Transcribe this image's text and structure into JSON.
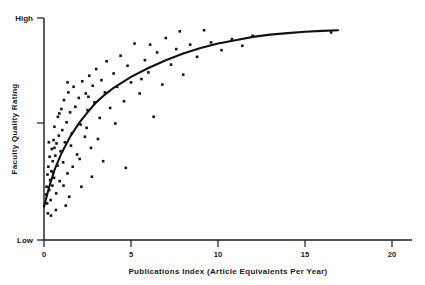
{
  "figure": {
    "background_color": "#ffffff",
    "ink_color": "#151515"
  },
  "axes": {
    "y": {
      "title": "Faculty Quality Rating",
      "low_label": "Low",
      "high_label": "High"
    },
    "x": {
      "title": "Publications Index (Article Equivalents Per Year)",
      "tick_labels": [
        "0",
        "5",
        "10",
        "15",
        "20"
      ]
    }
  },
  "chart_data": {
    "type": "scatter",
    "title": "",
    "subtitle": "",
    "xlabel": "Publications Index (Article Equivalents Per Year)",
    "ylabel": "Faculty Quality Rating",
    "xlim": [
      0,
      21.5
    ],
    "ylim": [
      0,
      100
    ],
    "xticks": [
      0,
      5,
      10,
      15,
      20
    ],
    "xtick_labels": [
      "0",
      "5",
      "10",
      "15",
      "20"
    ],
    "yticks": [
      0,
      50,
      100
    ],
    "ytick_labels": [
      "Low",
      "",
      "High"
    ],
    "grid": false,
    "legend": null,
    "annotations": [],
    "marker": "square",
    "marker_size_px": 2.6,
    "series": [
      {
        "name": "Departments",
        "points": [
          [
            0.12,
            20.5
          ],
          [
            0.15,
            24.0
          ],
          [
            0.18,
            16.5
          ],
          [
            0.2,
            29.5
          ],
          [
            0.22,
            12.0
          ],
          [
            0.25,
            33.0
          ],
          [
            0.3,
            22.5
          ],
          [
            0.32,
            37.5
          ],
          [
            0.35,
            27.0
          ],
          [
            0.38,
            18.0
          ],
          [
            0.42,
            31.0
          ],
          [
            0.45,
            41.0
          ],
          [
            0.48,
            24.5
          ],
          [
            0.5,
            35.5
          ],
          [
            0.55,
            45.0
          ],
          [
            0.58,
            28.0
          ],
          [
            0.6,
            51.0
          ],
          [
            0.65,
            38.0
          ],
          [
            0.7,
            21.0
          ],
          [
            0.72,
            43.5
          ],
          [
            0.78,
            33.5
          ],
          [
            0.8,
            55.5
          ],
          [
            0.85,
            47.0
          ],
          [
            0.9,
            26.5
          ],
          [
            0.95,
            40.0
          ],
          [
            1.0,
            59.0
          ],
          [
            1.05,
            49.5
          ],
          [
            1.1,
            35.0
          ],
          [
            1.15,
            63.0
          ],
          [
            1.2,
            44.0
          ],
          [
            1.3,
            53.0
          ],
          [
            1.35,
            30.0
          ],
          [
            1.4,
            66.5
          ],
          [
            1.5,
            57.5
          ],
          [
            1.55,
            42.5
          ],
          [
            1.6,
            48.0
          ],
          [
            1.7,
            69.0
          ],
          [
            1.8,
            60.0
          ],
          [
            1.9,
            38.5
          ],
          [
            2.0,
            64.0
          ],
          [
            2.1,
            52.0
          ],
          [
            2.2,
            71.5
          ],
          [
            2.35,
            46.5
          ],
          [
            2.4,
            66.0
          ],
          [
            2.5,
            58.5
          ],
          [
            2.6,
            74.0
          ],
          [
            2.7,
            41.5
          ],
          [
            2.8,
            69.5
          ],
          [
            2.9,
            62.0
          ],
          [
            3.0,
            77.0
          ],
          [
            3.2,
            55.0
          ],
          [
            3.3,
            72.0
          ],
          [
            3.5,
            66.5
          ],
          [
            3.6,
            80.5
          ],
          [
            3.8,
            59.5
          ],
          [
            4.0,
            75.0
          ],
          [
            4.2,
            69.0
          ],
          [
            4.4,
            83.0
          ],
          [
            4.6,
            62.5
          ],
          [
            4.7,
            32.5
          ],
          [
            4.8,
            78.5
          ],
          [
            5.0,
            71.0
          ],
          [
            5.2,
            88.5
          ],
          [
            5.5,
            66.0
          ],
          [
            5.8,
            81.0
          ],
          [
            6.0,
            75.5
          ],
          [
            6.3,
            55.5
          ],
          [
            6.5,
            84.5
          ],
          [
            6.8,
            70.0
          ],
          [
            7.0,
            91.0
          ],
          [
            7.3,
            79.0
          ],
          [
            7.6,
            86.0
          ],
          [
            8.0,
            74.5
          ],
          [
            8.4,
            88.0
          ],
          [
            8.8,
            82.5
          ],
          [
            9.2,
            94.5
          ],
          [
            9.6,
            89.0
          ],
          [
            10.2,
            85.5
          ],
          [
            10.8,
            90.5
          ],
          [
            11.4,
            87.5
          ],
          [
            12.0,
            92.0
          ],
          [
            16.5,
            93.5
          ],
          [
            1.25,
            15.5
          ],
          [
            1.45,
            19.5
          ],
          [
            2.15,
            24.0
          ],
          [
            2.75,
            28.5
          ],
          [
            3.4,
            35.5
          ],
          [
            0.28,
            44.0
          ],
          [
            0.52,
            30.5
          ],
          [
            0.68,
            13.5
          ],
          [
            0.88,
            57.0
          ],
          [
            1.12,
            24.5
          ],
          [
            1.65,
            33.0
          ],
          [
            2.05,
            36.5
          ],
          [
            2.45,
            50.5
          ],
          [
            3.1,
            45.5
          ],
          [
            4.1,
            52.5
          ],
          [
            5.6,
            72.5
          ],
          [
            6.1,
            88.0
          ],
          [
            7.8,
            94.0
          ],
          [
            0.4,
            11.0
          ],
          [
            0.6,
            41.5
          ],
          [
            1.35,
            71.0
          ],
          [
            2.55,
            64.5
          ]
        ]
      }
    ],
    "fit_curve": {
      "name": "Fitted logarithmic trend",
      "description": "Monotonic concave curve rising steeply near x=0 then flattening toward high ratings",
      "points": [
        [
          0.0,
          15.0
        ],
        [
          0.3,
          24.0
        ],
        [
          0.6,
          31.5
        ],
        [
          1.0,
          39.0
        ],
        [
          1.5,
          46.5
        ],
        [
          2.0,
          52.5
        ],
        [
          2.5,
          57.5
        ],
        [
          3.0,
          62.0
        ],
        [
          3.5,
          65.5
        ],
        [
          4.0,
          68.5
        ],
        [
          5.0,
          73.5
        ],
        [
          6.0,
          77.5
        ],
        [
          7.0,
          81.0
        ],
        [
          8.0,
          84.0
        ],
        [
          9.0,
          86.5
        ],
        [
          10.0,
          88.5
        ],
        [
          11.0,
          90.0
        ],
        [
          12.0,
          91.5
        ],
        [
          13.0,
          92.5
        ],
        [
          14.0,
          93.2
        ],
        [
          15.0,
          93.8
        ],
        [
          16.0,
          94.2
        ],
        [
          16.9,
          94.5
        ]
      ]
    }
  }
}
